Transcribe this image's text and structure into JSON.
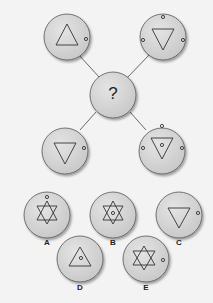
{
  "puzzle": {
    "center_symbol": "?",
    "options": [
      {
        "label": "A"
      },
      {
        "label": "B"
      },
      {
        "label": "C"
      },
      {
        "label": "D"
      },
      {
        "label": "E"
      }
    ]
  }
}
